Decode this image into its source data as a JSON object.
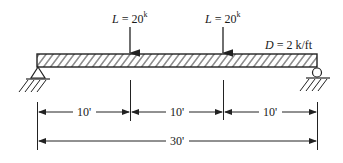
{
  "diagram": {
    "type": "simply-supported-beam",
    "span_total": "30'",
    "supports": [
      {
        "type": "pin",
        "position": "left"
      },
      {
        "type": "roller",
        "position": "right"
      }
    ],
    "point_loads": [
      {
        "symbol": "L",
        "eq": " = 20",
        "unit": "k",
        "position_ft": 10
      },
      {
        "symbol": "L",
        "eq": " = 20",
        "unit": "k",
        "position_ft": 20
      }
    ],
    "distributed_load": {
      "symbol": "D",
      "eq": " = 2 k/ft"
    },
    "dimensions": {
      "segments": [
        "10'",
        "10'",
        "10'"
      ],
      "total": "30'"
    }
  }
}
